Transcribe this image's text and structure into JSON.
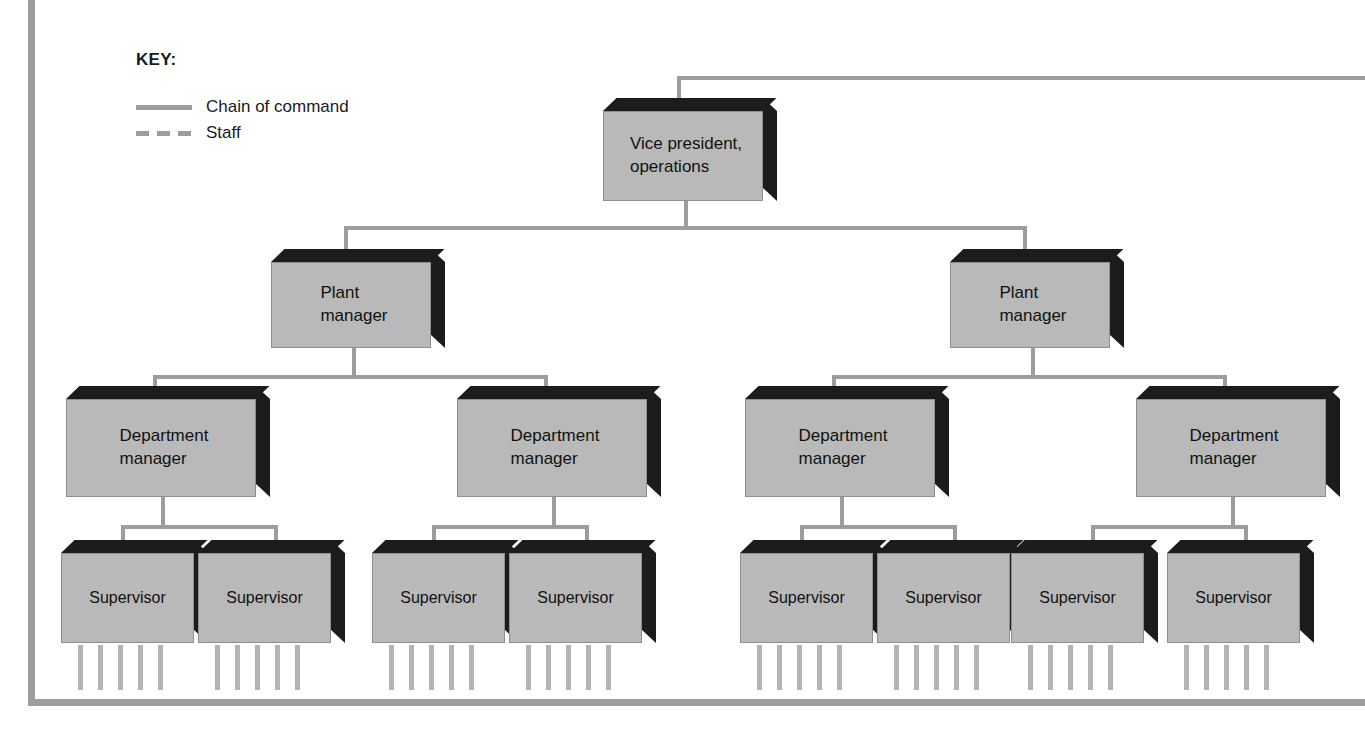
{
  "diagram": {
    "frame_color": "#9d9d9d",
    "box_fill": "#b9b9b9",
    "box_shadow": "#1c1c1c",
    "line_color": "#9d9d9d",
    "staff_line_color": "#b4b4b4"
  },
  "key": {
    "title": "KEY:",
    "entries": [
      {
        "label": "Chain of command",
        "style": "solid"
      },
      {
        "label": "Staff",
        "style": "dashed"
      }
    ]
  },
  "nodes": {
    "vp": {
      "label": "Vice president,\noperations",
      "line1": "Vice president,",
      "line2": "operations"
    },
    "plant_left": {
      "line1": "Plant",
      "line2": "manager"
    },
    "plant_right": {
      "line1": "Plant",
      "line2": "manager"
    },
    "dept_1": {
      "line1": "Department",
      "line2": "manager"
    },
    "dept_2": {
      "line1": "Department",
      "line2": "manager"
    },
    "dept_3": {
      "line1": "Department",
      "line2": "manager"
    },
    "dept_4": {
      "line1": "Department",
      "line2": "manager"
    },
    "sup_1": {
      "label": "Supervisor"
    },
    "sup_2": {
      "label": "Supervisor"
    },
    "sup_3": {
      "label": "Supervisor"
    },
    "sup_4": {
      "label": "Supervisor"
    },
    "sup_5": {
      "label": "Supervisor"
    },
    "sup_6": {
      "label": "Supervisor"
    },
    "sup_7": {
      "label": "Supervisor"
    },
    "sup_8": {
      "label": "Supervisor"
    }
  },
  "structure": {
    "levels": [
      "Vice president, operations",
      "Plant manager",
      "Department manager",
      "Supervisor"
    ],
    "plant_managers": 2,
    "department_managers_per_plant": 2,
    "supervisors_per_department": 2,
    "staff_lines_per_supervisor": 5
  }
}
